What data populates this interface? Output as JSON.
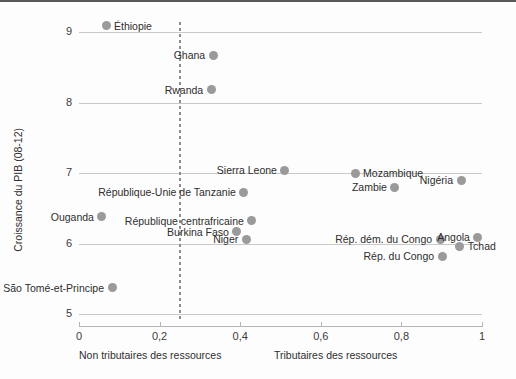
{
  "chart_data": {
    "type": "scatter",
    "title": "",
    "xlabel": "",
    "ylabel": "Croissance du PIB (08-12)",
    "xlim": [
      0,
      1
    ],
    "ylim": [
      5,
      9.4
    ],
    "grid": true,
    "legend_position": "none",
    "x_ticks": [
      "0",
      "0,2",
      "0,4",
      "0,6",
      "0,8",
      "1"
    ],
    "x_tick_values": [
      0,
      0.2,
      0.4,
      0.6,
      0.8,
      1
    ],
    "y_ticks": [
      "5",
      "6",
      "7",
      "8",
      "9"
    ],
    "y_tick_values": [
      5,
      6,
      7,
      8,
      9
    ],
    "annotations": {
      "threshold_line_x": 0.25,
      "group_left": "Non tributaires des ressources",
      "group_right": "Tributaires des ressources"
    },
    "points": [
      {
        "label": "Éthiopie",
        "x": 0.067,
        "y": 9.09,
        "label_side": "right"
      },
      {
        "label": "Ghana",
        "x": 0.333,
        "y": 8.67,
        "label_side": "left"
      },
      {
        "label": "Rwanda",
        "x": 0.328,
        "y": 8.18,
        "label_side": "left"
      },
      {
        "label": "Sierra Leone",
        "x": 0.511,
        "y": 7.04,
        "label_side": "left"
      },
      {
        "label": "Mozambique",
        "x": 0.685,
        "y": 7.0,
        "label_side": "right"
      },
      {
        "label": "Nigéria",
        "x": 0.948,
        "y": 6.9,
        "label_side": "left"
      },
      {
        "label": "République-Unie de Tanzanie",
        "x": 0.409,
        "y": 6.73,
        "label_side": "left"
      },
      {
        "label": "Zambie",
        "x": 0.784,
        "y": 6.8,
        "label_side": "left"
      },
      {
        "label": "Ouganda",
        "x": 0.057,
        "y": 6.38,
        "label_side": "left"
      },
      {
        "label": "République centrafricaine",
        "x": 0.429,
        "y": 6.32,
        "label_side": "left"
      },
      {
        "label": "Burkina Faso",
        "x": 0.392,
        "y": 6.17,
        "label_side": "left"
      },
      {
        "label": "Niger",
        "x": 0.415,
        "y": 6.06,
        "label_side": "left"
      },
      {
        "label": "Rép. dém. du Congo",
        "x": 0.896,
        "y": 6.06,
        "label_side": "left"
      },
      {
        "label": "Angola",
        "x": 0.99,
        "y": 6.09,
        "label_side": "left"
      },
      {
        "label": "Tchad",
        "x": 0.945,
        "y": 5.96,
        "label_side": "right"
      },
      {
        "label": "Rép. du Congo",
        "x": 0.901,
        "y": 5.82,
        "label_side": "left"
      },
      {
        "label": "São Tomé-et-Principe",
        "x": 0.082,
        "y": 5.37,
        "label_side": "left"
      }
    ]
  }
}
